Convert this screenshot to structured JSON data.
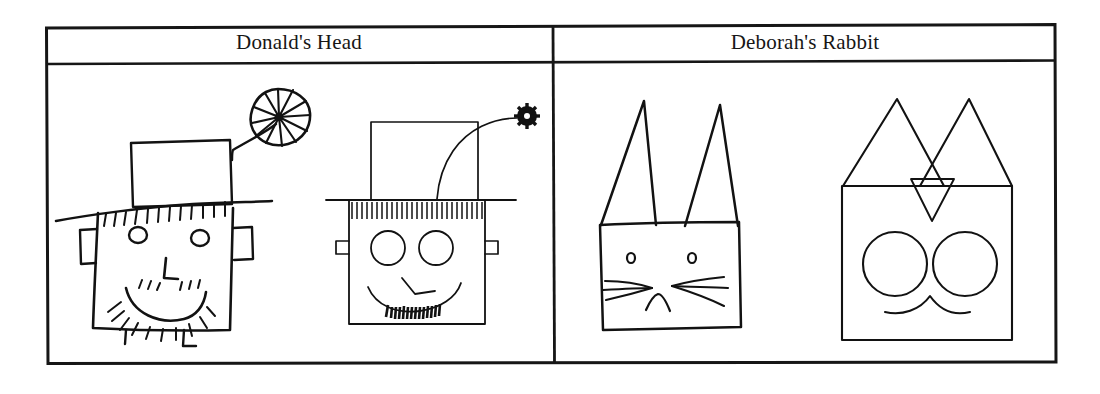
{
  "document": {
    "type": "scanned-figure-table",
    "background_color": "#ffffff",
    "ink_color": "#121212",
    "border_color": "#161616"
  },
  "table": {
    "columns": 2,
    "rows": 2,
    "headers": [
      {
        "label": "Donald's Head",
        "name": "header-donalds-head"
      },
      {
        "label": "Deborah's Rabbit",
        "name": "header-deborahs-rabbit"
      }
    ],
    "cells": [
      {
        "column": "Donald's Head",
        "figures": [
          {
            "name": "donald-head-hand-drawn",
            "caption": "",
            "description": "hand-drawn square face wearing a tall hat with a pinwheel flower, square ears, round eyes, L-shaped nose, smile with mustache and beard hatching, two small legs"
          },
          {
            "name": "donald-head-computer-drawn",
            "caption": "",
            "description": "computer-drawn square face with tall hat, curved stem ending in a small gear-flower, evenly hatched hair fringe, two circle eyes, angular nose, smile arc, dense beard marks, small square ears"
          }
        ]
      },
      {
        "column": "Deborah's Rabbit",
        "figures": [
          {
            "name": "deborah-rabbit-hand-drawn",
            "caption": "",
            "description": "hand-drawn square rabbit head with two narrow pointed ears, two tiny eyes, three whiskers per side, small inverted-V nose"
          },
          {
            "name": "deborah-rabbit-computer-drawn",
            "caption": "",
            "description": "computer-drawn square rabbit head with two large triangular ears, a small downward triangle between the ears, two large circular eyes, and a curved mouth"
          }
        ]
      }
    ]
  }
}
